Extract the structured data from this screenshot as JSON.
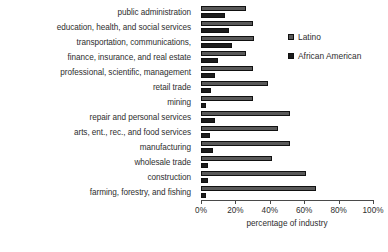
{
  "chart_data": {
    "type": "bar",
    "orientation": "horizontal",
    "title": "",
    "xlabel": "percentage of industry",
    "ylabel": "",
    "xlim": [
      0,
      100
    ],
    "xticks": [
      "0%",
      "20%",
      "40%",
      "60%",
      "80%",
      "100%"
    ],
    "xtick_values": [
      0,
      20,
      40,
      60,
      80,
      100
    ],
    "grid": false,
    "legend_position": "upper right",
    "categories": [
      "public administration",
      "education, health, and social services",
      "transportation, communications,",
      "finance, insurance, and real estate",
      "professional, scientific, management",
      "retail trade",
      "mining",
      "repair and personal services",
      "arts, ent., rec., and food services",
      "manufacturing",
      "wholesale trade",
      "construction",
      "farming, forestry, and fishing"
    ],
    "series": [
      {
        "name": "Latino",
        "color": "#595959",
        "values": [
          26,
          30,
          31,
          26,
          30,
          39,
          30,
          52,
          45,
          52,
          41,
          61,
          67
        ]
      },
      {
        "name": "African American",
        "color": "#1c1c1c",
        "values": [
          14,
          16,
          18,
          10,
          8,
          6,
          3,
          8,
          5,
          7,
          4,
          4,
          3
        ]
      }
    ]
  },
  "legend": {
    "items": [
      {
        "label": "Latino",
        "color": "#595959"
      },
      {
        "label": "African American",
        "color": "#1c1c1c"
      }
    ]
  }
}
